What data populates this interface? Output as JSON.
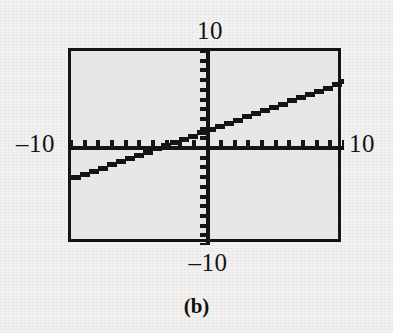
{
  "figure": {
    "caption": "(b)",
    "background_color": "#f3f2f0",
    "plot_background_color": "#e7e7e5",
    "frame_color": "#141414"
  },
  "labels": {
    "top": "10",
    "bottom": "–10",
    "left": "–10",
    "right": "10"
  },
  "chart_data": {
    "type": "line",
    "title": "",
    "subtitle": "",
    "xlabel": "",
    "ylabel": "",
    "xlim": [
      -10,
      10
    ],
    "ylim": [
      -10,
      10
    ],
    "xtick_labels": [
      "-10",
      "10"
    ],
    "ytick_labels": [
      "-10",
      "10"
    ],
    "tick_step": 1,
    "grid": false,
    "legend": "none",
    "axes_style": "calculator-crosshair",
    "render_style": "stepped-pixelated",
    "line_color": "#141414",
    "line_width_px": 5,
    "series": [
      {
        "name": "y = 0.5x + 2",
        "slope": 0.5,
        "intercept": 2,
        "x": [
          -10,
          -8,
          -6,
          -4,
          -2,
          0,
          2,
          4,
          6,
          8,
          10
        ],
        "values": [
          -3,
          -2,
          -1,
          0,
          1,
          2,
          3,
          4,
          5,
          6,
          7
        ]
      }
    ],
    "annotations": [
      {
        "text": "10",
        "position": "top-of-y-axis"
      },
      {
        "text": "-10",
        "position": "bottom-of-y-axis"
      },
      {
        "text": "-10",
        "position": "left-of-x-axis"
      },
      {
        "text": "10",
        "position": "right-of-x-axis"
      }
    ]
  }
}
